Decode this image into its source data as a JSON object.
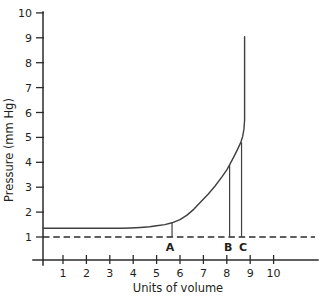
{
  "chart_data": {
    "type": "line",
    "title": "",
    "xlabel": "Units of volume",
    "ylabel": "Pressure (mm Hg)",
    "x_ticks": [
      1,
      2,
      3,
      4,
      5,
      6,
      7,
      8,
      9,
      10
    ],
    "y_ticks": [
      1,
      2,
      3,
      4,
      5,
      6,
      7,
      8,
      9,
      10
    ],
    "xlim": [
      0.15,
      11.9
    ],
    "ylim": [
      0,
      10
    ],
    "grid": false,
    "legend": false,
    "line_color": "#3f3f3f",
    "series": [
      {
        "name": "pressure-volume-curve",
        "points": [
          [
            0.15,
            1.35
          ],
          [
            0.6,
            1.35
          ],
          [
            1.2,
            1.35
          ],
          [
            1.8,
            1.35
          ],
          [
            2.4,
            1.35
          ],
          [
            3.0,
            1.35
          ],
          [
            3.5,
            1.35
          ],
          [
            3.9,
            1.36
          ],
          [
            4.3,
            1.38
          ],
          [
            4.7,
            1.41
          ],
          [
            5.0,
            1.45
          ],
          [
            5.35,
            1.5
          ],
          [
            5.66,
            1.57
          ],
          [
            6.0,
            1.7
          ],
          [
            6.3,
            1.88
          ],
          [
            6.6,
            2.12
          ],
          [
            6.9,
            2.42
          ],
          [
            7.2,
            2.72
          ],
          [
            7.5,
            3.05
          ],
          [
            7.8,
            3.42
          ],
          [
            8.0,
            3.7
          ],
          [
            8.12,
            3.9
          ],
          [
            8.3,
            4.22
          ],
          [
            8.45,
            4.5
          ],
          [
            8.6,
            4.8
          ],
          [
            8.68,
            5.05
          ],
          [
            8.73,
            5.32
          ],
          [
            8.76,
            5.7
          ],
          [
            8.76,
            9.05
          ]
        ]
      }
    ],
    "reference_line": {
      "style": "dashed-horizontal",
      "y": 1
    },
    "markers": [
      {
        "label": "A",
        "x": 5.66,
        "y_bottom": 1,
        "y_top": 1.57,
        "label_dx": -2
      },
      {
        "label": "B",
        "x": 8.12,
        "y_bottom": 1,
        "y_top": 3.9,
        "label_dx": -1.5
      },
      {
        "label": "C",
        "x": 8.63,
        "y_bottom": 1,
        "y_top": 4.8,
        "label_dx": 1.5
      }
    ]
  }
}
